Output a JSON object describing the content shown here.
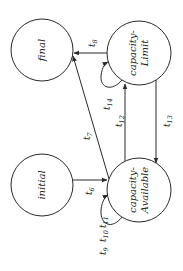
{
  "diagram": {
    "type": "state-machine",
    "orientation": "rotated-90-ccw",
    "colors": {
      "stroke": "#2a2a2a",
      "background": "#ffffff",
      "text": "#1a1a1a"
    },
    "states": [
      {
        "id": "final",
        "line1": "final",
        "line2": ""
      },
      {
        "id": "capacity-limit",
        "line1": "capacity-",
        "line2": "Limit"
      },
      {
        "id": "initial",
        "line1": "initial",
        "line2": ""
      },
      {
        "id": "capacity-available",
        "line1": "capacity-",
        "line2": "Available"
      }
    ],
    "transitions": [
      {
        "id": "t6",
        "base": "t",
        "sub": "6",
        "from": "initial",
        "to": "capacity-Available"
      },
      {
        "id": "t7",
        "base": "t",
        "sub": "7",
        "from": "capacity-Available",
        "to": "final"
      },
      {
        "id": "t8",
        "base": "t",
        "sub": "8",
        "from": "capacity-Limit",
        "to": "final"
      },
      {
        "id": "t9",
        "base": "t",
        "sub": "9",
        "from": "capacity-Available",
        "to": "capacity-Available"
      },
      {
        "id": "t10",
        "base": "t",
        "sub": "10",
        "from": "capacity-Available",
        "to": "capacity-Available"
      },
      {
        "id": "t11",
        "base": "t",
        "sub": "11",
        "from": "capacity-Available",
        "to": "capacity-Available"
      },
      {
        "id": "t12",
        "base": "t",
        "sub": "12",
        "from": "capacity-Available",
        "to": "capacity-Limit"
      },
      {
        "id": "t13",
        "base": "t",
        "sub": "13",
        "from": "capacity-Limit",
        "to": "capacity-Available"
      },
      {
        "id": "t14",
        "base": "t",
        "sub": "14",
        "from": "capacity-Limit",
        "to": "capacity-Limit"
      }
    ]
  }
}
